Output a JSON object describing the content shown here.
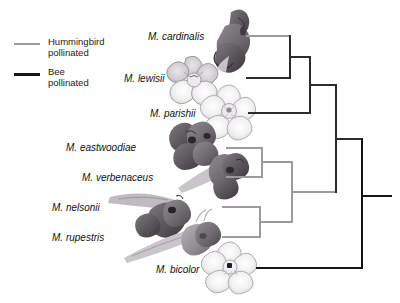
{
  "figure": {
    "type": "phylogenetic-cladogram",
    "genus": "Mimulus",
    "width": 400,
    "height": 303,
    "background": "#ffffff"
  },
  "legend": {
    "items": [
      {
        "id": "hummingbird",
        "label": "Hummingbird\npollinated",
        "color": "#9b9b9b",
        "line_weight": "thin"
      },
      {
        "id": "bee",
        "label": "Bee\npollinated",
        "color": "#151515",
        "line_weight": "thick"
      }
    ]
  },
  "taxa": [
    {
      "id": "cardinalis",
      "label": "M. cardinalis",
      "syndrome": "hummingbird",
      "tip_y": 36,
      "label_x": 148,
      "label_y": 31,
      "flower": {
        "kind": "tubular",
        "x": 214,
        "y": 8,
        "w": 44,
        "h": 52,
        "petal": "#6e6a6b",
        "dark": "#4a4647"
      }
    },
    {
      "id": "lewisii",
      "label": "M. lewisii",
      "syndrome": "bee",
      "tip_y": 78,
      "label_x": 124,
      "label_y": 73,
      "flower": {
        "kind": "open5",
        "x": 168,
        "y": 55,
        "w": 48,
        "h": 50,
        "petal": "#c9c7cb",
        "dark": "#8e8b90"
      }
    },
    {
      "id": "parishii",
      "label": "M. parishii",
      "syndrome": "bee",
      "tip_y": 113,
      "label_x": 150,
      "label_y": 108,
      "flower": {
        "kind": "open5",
        "x": 200,
        "y": 85,
        "w": 50,
        "h": 50,
        "petal": "#f2f1f2",
        "dark": "#b9b7ba"
      }
    },
    {
      "id": "eastwoodiae",
      "label": "M. eastwoodiae",
      "syndrome": "hummingbird",
      "tip_y": 148,
      "label_x": 66,
      "label_y": 142,
      "flower": {
        "kind": "tubular",
        "x": 167,
        "y": 122,
        "w": 52,
        "h": 46,
        "petal": "#58555a",
        "dark": "#3b383c"
      }
    },
    {
      "id": "verbenaceus",
      "label": "M. verbenaceus",
      "syndrome": "hummingbird",
      "tip_y": 177,
      "label_x": 82,
      "label_y": 172,
      "flower": {
        "kind": "tubular",
        "x": 178,
        "y": 155,
        "w": 56,
        "h": 44,
        "petal": "#6a676c",
        "dark": "#464347"
      }
    },
    {
      "id": "nelsonii",
      "label": "M. nelsonii",
      "syndrome": "hummingbird",
      "tip_y": 207,
      "label_x": 52,
      "label_y": 202,
      "flower": {
        "kind": "tubular",
        "x": 108,
        "y": 190,
        "w": 78,
        "h": 46,
        "petal": "#4e4b50",
        "dark": "#343136"
      }
    },
    {
      "id": "rupestris",
      "label": "M. rupestris",
      "syndrome": "hummingbird",
      "tip_y": 237,
      "label_x": 52,
      "label_y": 232,
      "flower": {
        "kind": "tubular",
        "x": 120,
        "y": 222,
        "w": 84,
        "h": 44,
        "petal": "#8b878c",
        "dark": "#5d595e"
      }
    },
    {
      "id": "bicolor",
      "label": "M. bicolor",
      "syndrome": "bee",
      "tip_y": 268,
      "label_x": 156,
      "label_y": 264,
      "flower": {
        "kind": "open5",
        "x": 200,
        "y": 243,
        "w": 48,
        "h": 48,
        "petal": "#f4f3f4",
        "dark": "#bdbbbe"
      }
    }
  ],
  "tree": {
    "tip_x": {
      "cardinalis": 246,
      "lewisii": 246,
      "parishii": 248,
      "eastwoodiae": 226,
      "verbenaceus": 226,
      "nelsonii": 222,
      "rupestris": 222,
      "bicolor": 256
    },
    "nodes": [
      {
        "id": "n-cardinalis-lewisii",
        "x": 290,
        "children_y": [
          36,
          78
        ],
        "color": "#2b2b2b"
      },
      {
        "id": "n-parishii-clade",
        "x": 310,
        "children_y": [
          57,
          113
        ],
        "color": "#2b2b2b"
      },
      {
        "id": "n-eastwoodiae-verbenaceus",
        "x": 262,
        "children_y": [
          148,
          177
        ],
        "color": "#9b9b9b"
      },
      {
        "id": "n-nelsonii-rupestris",
        "x": 260,
        "children_y": [
          207,
          237
        ],
        "color": "#9b9b9b"
      },
      {
        "id": "n-hummingbird-clade",
        "x": 292,
        "children_y": [
          162,
          222
        ],
        "color": "#9b9b9b"
      },
      {
        "id": "n-crown",
        "x": 336,
        "children_y": [
          85,
          192
        ],
        "color": "#2b2b2b"
      },
      {
        "id": "n-root",
        "x": 362,
        "children_y": [
          139,
          268
        ],
        "color": "#151515"
      }
    ],
    "root_stem": {
      "x_start": 362,
      "x_end": 392,
      "y": 196,
      "color": "#151515"
    }
  }
}
